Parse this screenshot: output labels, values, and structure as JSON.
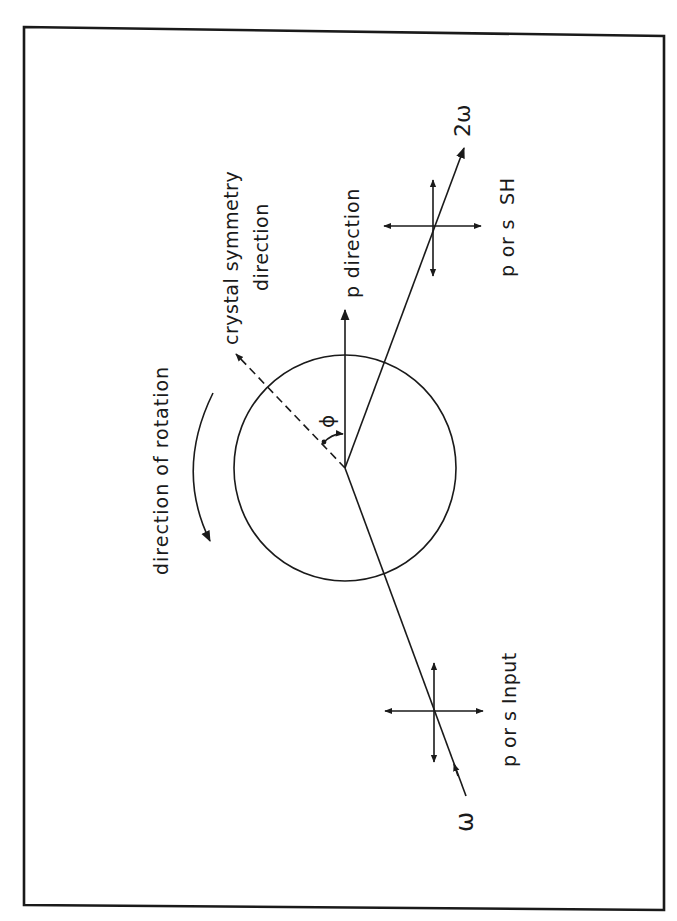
{
  "figure": {
    "orientation": "rotated-90-clockwise",
    "frame": {
      "stroke_color": "#1a1a1a"
    },
    "labels": {
      "rotation": "direction of rotation",
      "crystal_line1": "crystal symmetry",
      "crystal_line2": "direction",
      "p_direction": "p direction",
      "angle_symbol": "ϕ",
      "output_freq": "2ω",
      "output_pol": "p or s  SH",
      "input_freq": "ω",
      "input_pol": "p or s Input"
    },
    "elements": {
      "sample_disc": "circle",
      "incident_beam": "line from ω source to sample center",
      "reflected_beam": "line from sample center to 2ω output",
      "polarization_crosses": [
        "input",
        "output"
      ],
      "angle": "ϕ between crystal symmetry direction and p direction"
    }
  }
}
